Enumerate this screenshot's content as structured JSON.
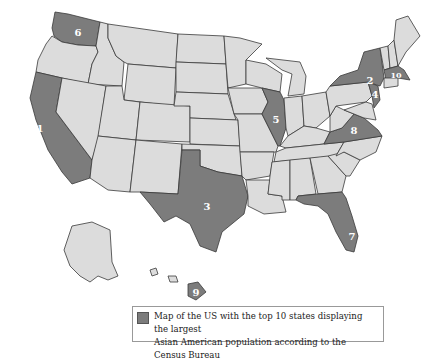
{
  "map": {
    "title": "Map of the US with the top 10 states displaying the largest Asian American population according to the Census Bureau",
    "colors": {
      "highlight": "#7c7c7c",
      "base": "#dcdcdc",
      "border": "#3a3a3a"
    },
    "ranked_states": [
      {
        "rank": "1",
        "state": "California"
      },
      {
        "rank": "2",
        "state": "New York"
      },
      {
        "rank": "3",
        "state": "Texas"
      },
      {
        "rank": "4",
        "state": "New Jersey"
      },
      {
        "rank": "5",
        "state": "Illinois"
      },
      {
        "rank": "6",
        "state": "Washington"
      },
      {
        "rank": "7",
        "state": "Florida"
      },
      {
        "rank": "8",
        "state": "Virginia"
      },
      {
        "rank": "9",
        "state": "Hawaii"
      },
      {
        "rank": "10",
        "state": "Massachusetts"
      }
    ]
  },
  "legend": {
    "line1": "Map of the US with the top 10 states displaying the largest",
    "line2": "Asian American population according to the Census Bureau"
  }
}
